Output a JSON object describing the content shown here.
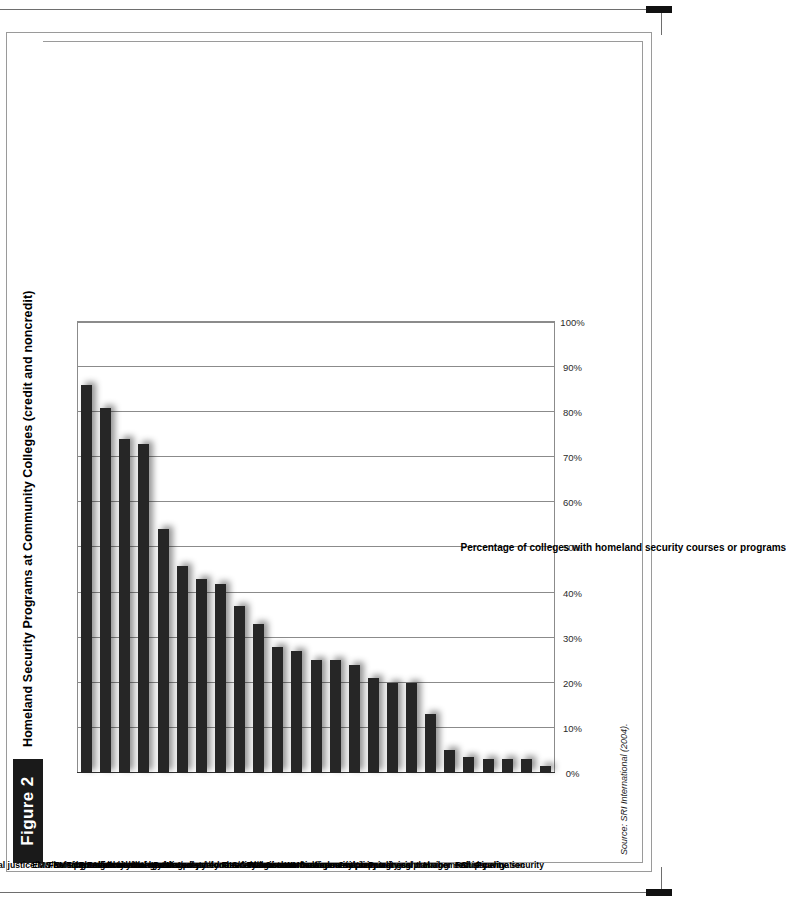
{
  "figure": {
    "number_label": "Figure 2",
    "title": "Homeland Security Programs at Community Colleges (credit and noncredit)",
    "source": "Source: SRI International (2004)."
  },
  "chart_data": {
    "type": "bar",
    "orientation": "vertical",
    "title": "Homeland Security Programs at Community Colleges (credit and noncredit)",
    "xlabel": "",
    "ylabel": "Percentage of colleges with homeland security courses or programs",
    "ylim": [
      0,
      100
    ],
    "grid": true,
    "legend": "none",
    "tick_labels": [
      "0%",
      "10%",
      "20%",
      "30%",
      "40%",
      "50%",
      "60%",
      "70%",
      "80%",
      "90%",
      "100%"
    ],
    "tick_values": [
      0,
      10,
      20,
      30,
      40,
      50,
      60,
      70,
      80,
      90,
      100
    ],
    "bar_color": "#262626",
    "categories": [
      "Nursing",
      "Criminal justice/law enforcement",
      "EMS/EMT/paramedical",
      "Allied health",
      "Fire science/fire technology",
      "HazMat",
      "Cybersecurity/Internet security",
      "Environmental health and safety",
      "Emergency management/preparedness",
      "GIS/GPS",
      "Public safety communications",
      "Forensic sciences",
      "Food chain management/food safety/agri-terrorism",
      "Search and rescue",
      "Water/waste management",
      "Aviation",
      "Risk assessment/security planning",
      "WMD awareness/preparedness",
      "Commercial/industrial air quality control",
      "Airport security training/planning",
      "Power grid management",
      "Harbor security",
      "Rail security",
      "Ship navigation",
      "Pipeline security"
    ],
    "values": [
      86,
      81,
      74,
      73,
      54,
      46,
      43,
      42,
      37,
      33,
      28,
      27,
      25,
      25,
      24,
      21,
      20,
      20,
      13,
      5,
      3.5,
      3,
      3,
      3,
      1.5
    ]
  }
}
